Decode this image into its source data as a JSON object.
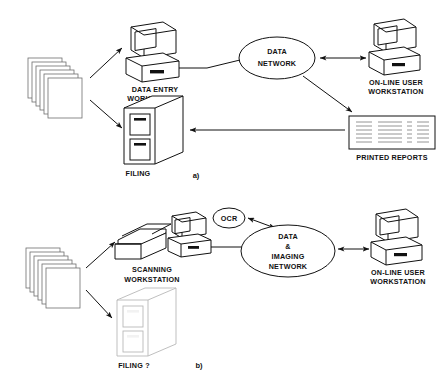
{
  "figure": {
    "domain": "diagram",
    "type": "system-architecture-comparison",
    "background_color": "#ffffff",
    "line_color": "#111111",
    "pale_line_color": "#b8b8b8",
    "panels": [
      {
        "id": "a",
        "caption": "a)",
        "title_implied": "Conventional data entry workflow",
        "nodes": [
          {
            "id": "paper-stack-a",
            "icon": "document-stack-icon",
            "label": "",
            "kind": "paper-documents"
          },
          {
            "id": "data-entry-ws",
            "icon": "workstation-icon",
            "label_line1": "DATA ENTRY",
            "label_line2": "WORKSTATION",
            "kind": "workstation"
          },
          {
            "id": "filing-a",
            "icon": "filing-cabinet-icon",
            "label_line1": "FILING",
            "label_line2": "",
            "kind": "filing-cabinet"
          },
          {
            "id": "data-network",
            "icon": "network-cloud-icon",
            "label_line1": "DATA",
            "label_line2": "NETWORK",
            "kind": "network-ellipse"
          },
          {
            "id": "online-user-ws-a",
            "icon": "workstation-icon",
            "label_line1": "ON-LINE USER",
            "label_line2": "WORKSTATION",
            "kind": "workstation"
          },
          {
            "id": "printed-reports",
            "icon": "printed-report-icon",
            "label_line1": "PRINTED REPORTS",
            "label_line2": "",
            "kind": "report-sheet"
          }
        ],
        "edges": [
          {
            "from": "paper-stack-a",
            "to": "data-entry-ws",
            "arrow": "single"
          },
          {
            "from": "paper-stack-a",
            "to": "filing-a",
            "arrow": "single"
          },
          {
            "from": "data-entry-ws",
            "to": "data-network",
            "arrow": "none"
          },
          {
            "from": "data-network",
            "to": "online-user-ws-a",
            "arrow": "double"
          },
          {
            "from": "data-network",
            "to": "printed-reports",
            "arrow": "single"
          },
          {
            "from": "printed-reports",
            "to": "filing-a",
            "arrow": "single"
          }
        ]
      },
      {
        "id": "b",
        "caption": "b)",
        "title_implied": "Imaging / OCR based workflow",
        "nodes": [
          {
            "id": "paper-stack-b",
            "icon": "document-stack-icon",
            "label": "",
            "kind": "paper-documents"
          },
          {
            "id": "scanning-ws",
            "icon": "scanner-icon",
            "label_line1": "SCANNING",
            "label_line2": "WORKSTATION",
            "kind": "scanner"
          },
          {
            "id": "scan-host",
            "icon": "workstation-icon",
            "label_line1": "",
            "label_line2": "",
            "kind": "workstation"
          },
          {
            "id": "filing-b",
            "icon": "filing-cabinet-icon",
            "label_line1": "FILING ?",
            "label_line2": "",
            "kind": "filing-cabinet",
            "style": "faded"
          },
          {
            "id": "ocr",
            "icon": "ocr-node-icon",
            "label_line1": "OCR",
            "label_line2": "",
            "kind": "small-ellipse"
          },
          {
            "id": "imaging-network",
            "icon": "network-cloud-icon",
            "label_line1": "DATA",
            "label_line2": "&",
            "label_line3": "IMAGING",
            "label_line4": "NETWORK",
            "kind": "network-ellipse"
          },
          {
            "id": "online-user-ws-b",
            "icon": "workstation-icon",
            "label_line1": "ON-LINE USER",
            "label_line2": "WORKSTATION",
            "kind": "workstation"
          }
        ],
        "edges": [
          {
            "from": "paper-stack-b",
            "to": "scanning-ws",
            "arrow": "single"
          },
          {
            "from": "paper-stack-b",
            "to": "filing-b",
            "arrow": "single"
          },
          {
            "from": "scan-host",
            "to": "scanning-ws",
            "arrow": "single"
          },
          {
            "from": "scan-host",
            "to": "imaging-network",
            "arrow": "none"
          },
          {
            "from": "imaging-network",
            "to": "ocr",
            "arrow": "double"
          },
          {
            "from": "imaging-network",
            "to": "online-user-ws-b",
            "arrow": "double"
          }
        ]
      }
    ],
    "labels": {
      "data_entry_l1": "DATA ENTRY",
      "data_entry_l2": "WORKSTATION",
      "filing_a": "FILING",
      "data_network_l1": "DATA",
      "data_network_l2": "NETWORK",
      "online_user_a_l1": "ON-LINE USER",
      "online_user_a_l2": "WORKSTATION",
      "printed_reports": "PRINTED REPORTS",
      "caption_a": "a)",
      "scanning_l1": "SCANNING",
      "scanning_l2": "WORKSTATION",
      "filing_b": "FILING ?",
      "ocr": "OCR",
      "imaging_l1": "DATA",
      "imaging_l2": "&",
      "imaging_l3": "IMAGING",
      "imaging_l4": "NETWORK",
      "online_user_b_l1": "ON-LINE USER",
      "online_user_b_l2": "WORKSTATION",
      "caption_b": "b)"
    }
  }
}
